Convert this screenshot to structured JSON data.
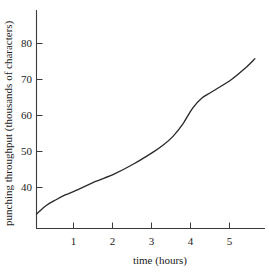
{
  "chart_data": {
    "type": "line",
    "title": "",
    "xlabel": "time (hours)",
    "ylabel": "punching throughput (thousands of characters)",
    "xlim": [
      0,
      5.75
    ],
    "ylim": [
      32,
      86
    ],
    "grid": false,
    "legend": "none",
    "xticks": [
      1,
      2,
      3,
      4,
      5
    ],
    "xtick_labels": [
      "1",
      "2",
      "3",
      "4",
      "5"
    ],
    "yticks": [
      40,
      50,
      60,
      70,
      80
    ],
    "ytick_labels": [
      "40",
      "50",
      "60",
      "70",
      "80"
    ],
    "series": [
      {
        "name": "punching throughput",
        "color": "#2a2a2a",
        "x": [
          0.0,
          0.25,
          0.5,
          0.75,
          1.0,
          1.5,
          2.0,
          2.5,
          3.0,
          3.25,
          3.5,
          3.75,
          4.0,
          4.25,
          4.5,
          5.0,
          5.4,
          5.6
        ],
        "y": [
          32.6,
          35.0,
          36.6,
          38.0,
          39.1,
          41.6,
          43.8,
          46.6,
          49.9,
          51.8,
          54.2,
          57.6,
          62.0,
          64.9,
          66.6,
          70.0,
          73.6,
          75.8
        ]
      }
    ]
  },
  "axes": {
    "x_axis_label": "time (hours)",
    "y_axis_label": "punching throughput (thousands of characters)"
  }
}
